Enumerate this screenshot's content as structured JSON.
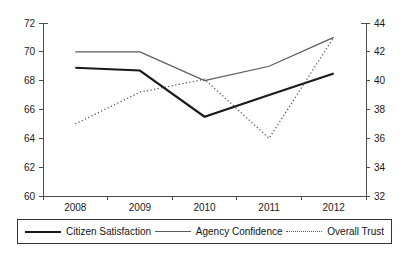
{
  "chart_data": {
    "type": "line",
    "title": "",
    "xlabel": "",
    "ylabel": "",
    "categories": [
      "2008",
      "2009",
      "2010",
      "2011",
      "2012"
    ],
    "x": [
      2008,
      2009,
      2010,
      2011,
      2012
    ],
    "grid": false,
    "legend_position": "bottom",
    "axes": {
      "left": {
        "label": "",
        "ylim": [
          60,
          72
        ],
        "ticks": [
          60,
          62,
          64,
          66,
          68,
          70,
          72
        ],
        "tick_labels": [
          "60",
          "62",
          "64",
          "66",
          "68",
          "70",
          "72"
        ]
      },
      "right": {
        "label": "",
        "ylim": [
          32,
          44
        ],
        "ticks": [
          32,
          34,
          36,
          38,
          40,
          42,
          44
        ],
        "tick_labels": [
          "32",
          "34",
          "36",
          "38",
          "40",
          "42",
          "44"
        ]
      },
      "x": {
        "tick_labels": [
          "2008",
          "2009",
          "2010",
          "2011",
          "2012"
        ]
      }
    },
    "series": [
      {
        "name": "Citizen Satisfaction",
        "axis": "left",
        "style": "solid-thick",
        "color": "#1a1a1a",
        "values": [
          68.9,
          68.7,
          65.5,
          67.0,
          68.5
        ]
      },
      {
        "name": "Agency Confidence",
        "axis": "left",
        "style": "solid-thin",
        "color": "#5a5a5a",
        "values": [
          70.0,
          70.0,
          68.0,
          69.0,
          71.0
        ]
      },
      {
        "name": "Overall Trust",
        "axis": "right",
        "style": "dotted",
        "color": "#545454",
        "values": [
          37.0,
          39.2,
          40.1,
          36.0,
          43.0
        ]
      }
    ]
  },
  "legend": {
    "items": [
      {
        "label": "Citizen Satisfaction",
        "swatch": "solid-thick-line-swatch"
      },
      {
        "label": "Agency Confidence",
        "swatch": "solid-thin-line-swatch"
      },
      {
        "label": "Overall Trust",
        "swatch": "dotted-line-swatch"
      }
    ]
  }
}
